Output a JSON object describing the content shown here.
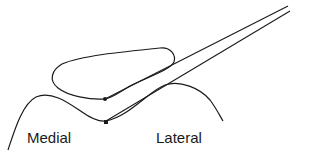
{
  "diagram": {
    "labels": {
      "medial": "Medial",
      "lateral": "Lateral"
    },
    "colors": {
      "stroke": "#1a1a1a",
      "background": "#ffffff"
    },
    "elements": [
      "condyle-outline",
      "upper-blob-outline",
      "instrument-upper-arm",
      "instrument-lower-arm",
      "upper-contact-point",
      "lower-contact-point"
    ]
  }
}
